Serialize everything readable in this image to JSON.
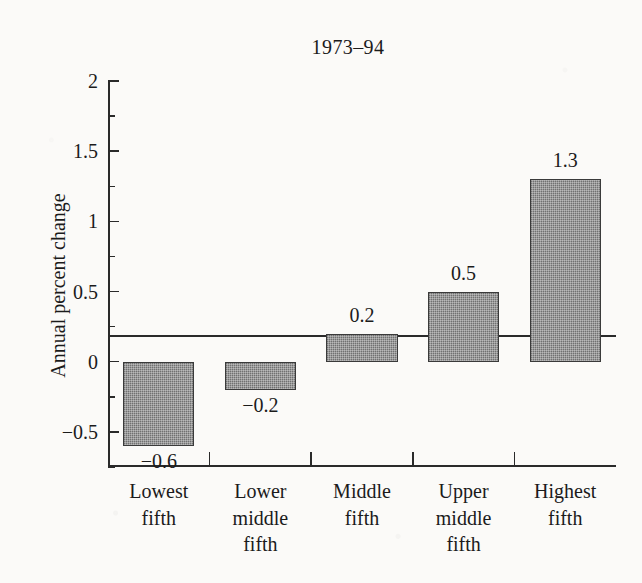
{
  "chart_data": {
    "type": "bar",
    "title": "1973–94",
    "xlabel": "",
    "ylabel": "Annual percent change",
    "categories": [
      "Lowest fifth",
      "Lower middle fifth",
      "Middle fifth",
      "Upper middle fifth",
      "Highest fifth"
    ],
    "category_lines": [
      [
        "Lowest",
        "fifth"
      ],
      [
        "Lower",
        "middle",
        "fifth"
      ],
      [
        "Middle",
        "fifth"
      ],
      [
        "Upper",
        "middle",
        "fifth"
      ],
      [
        "Highest",
        "fifth"
      ]
    ],
    "values": [
      -0.6,
      -0.2,
      0.2,
      0.5,
      1.3
    ],
    "value_labels": [
      "−0.6",
      "−0.2",
      "0.2",
      "0.5",
      "1.3"
    ],
    "ylim": [
      -0.75,
      2
    ],
    "ytick_major": [
      2,
      1.5,
      1,
      0.5,
      0,
      -0.5
    ],
    "ytick_major_labels": [
      "2",
      "1.5",
      "1",
      "0.5",
      "0",
      "−0.5"
    ],
    "ytick_minor": [
      1.75,
      1.25,
      0.75,
      0.25,
      -0.25,
      -0.75
    ],
    "grid": false,
    "legend": null,
    "bar_color": "#8d8d8d",
    "bar_edge_color": "#3a3a3a",
    "axis_color": "#2a2a2a",
    "background_color": "#fbfaf8",
    "text_color": "#1b1b1b"
  }
}
